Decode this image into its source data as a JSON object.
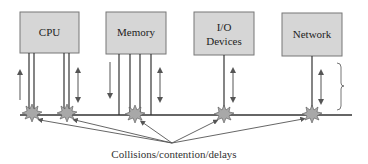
{
  "diagram": {
    "components": [
      {
        "id": "cpu",
        "label_lines": [
          "CPU"
        ]
      },
      {
        "id": "memory",
        "label_lines": [
          "Memory"
        ]
      },
      {
        "id": "io",
        "label_lines": [
          "I/O",
          "Devices"
        ]
      },
      {
        "id": "network",
        "label_lines": [
          "Network"
        ]
      }
    ],
    "caption": "Collisions/contention/delays",
    "colors": {
      "box_fill": "#d6d6d6",
      "box_stroke": "#777777",
      "line": "#333333",
      "arrow": "#555555",
      "burst_fill": "#a8a8a8"
    }
  }
}
